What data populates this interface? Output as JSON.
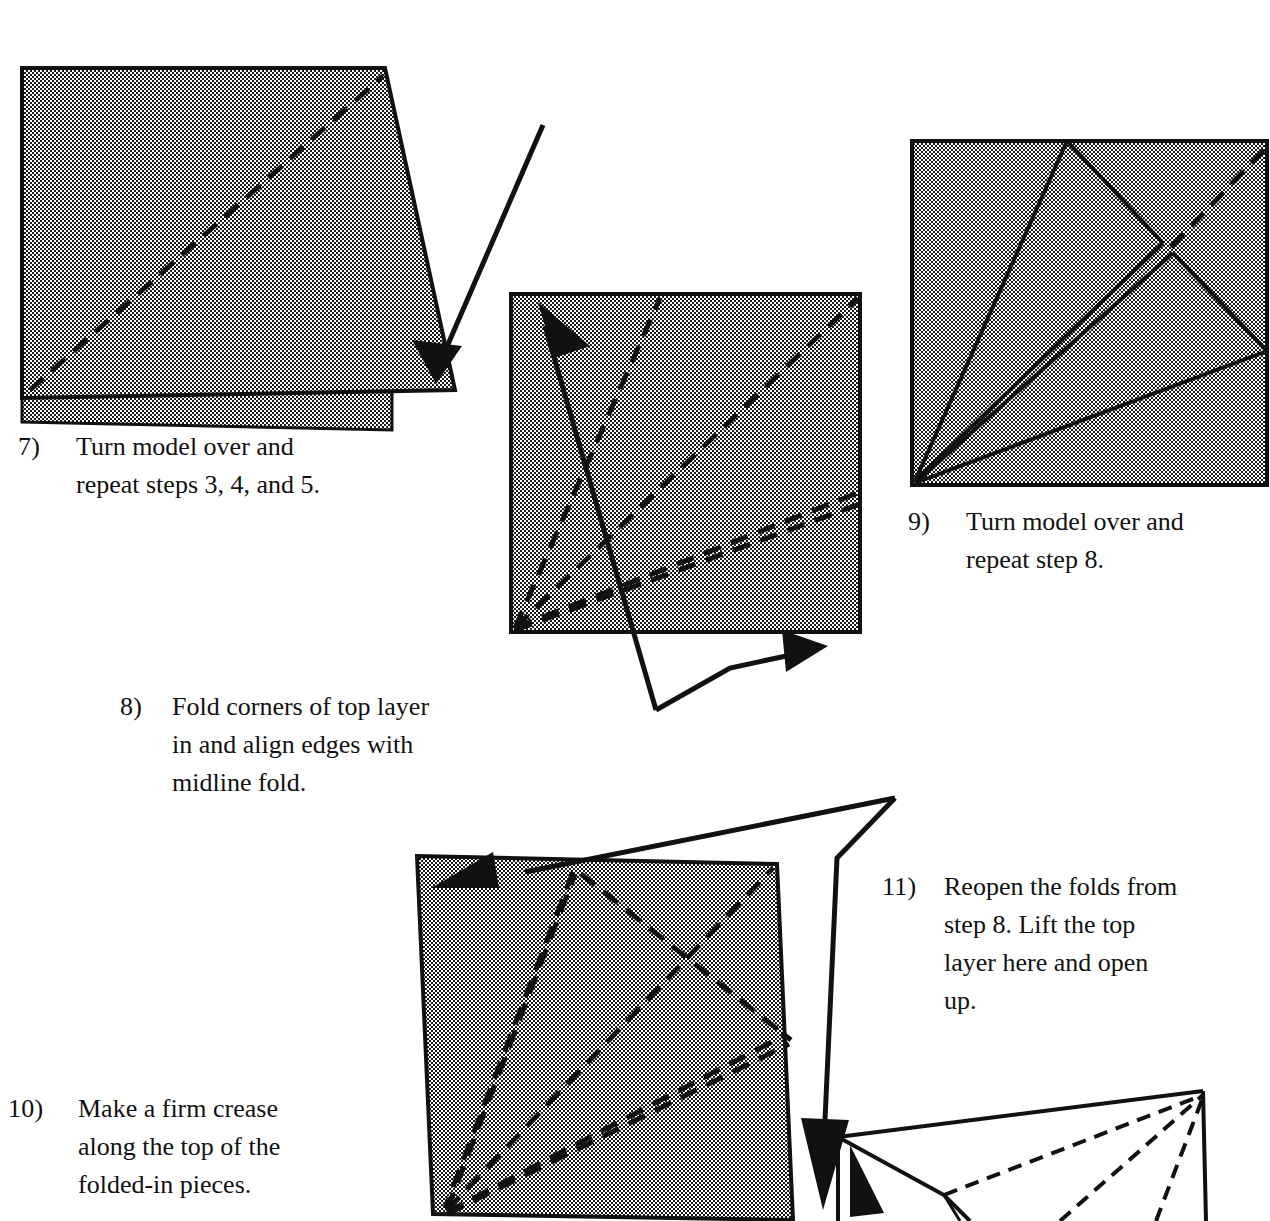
{
  "document": {
    "type": "origami-instruction-page",
    "background_color": "#ffffff",
    "ink_color": "#111111",
    "paper_fill": "halftone-gray-50"
  },
  "steps": [
    {
      "id": "step-7",
      "number": "7)",
      "lines": [
        "Turn model over and",
        "repeat steps 3, 4, and 5."
      ],
      "text": "Turn model over and repeat steps 3, 4, and 5."
    },
    {
      "id": "step-8",
      "number": "8)",
      "lines": [
        "Fold corners of top layer",
        "in and align edges with",
        "midline fold."
      ],
      "text": "Fold corners of top layer in and align edges with midline fold."
    },
    {
      "id": "step-9",
      "number": "9)",
      "lines": [
        "Turn model over and",
        "repeat step 8."
      ],
      "text": "Turn model over and repeat step 8."
    },
    {
      "id": "step-10",
      "number": "10)",
      "lines": [
        "Make a firm crease",
        "along the top of the",
        "folded-in pieces."
      ],
      "text": "Make a firm crease along the top of the folded-in pieces."
    },
    {
      "id": "step-11",
      "number": "11)",
      "lines": [
        "Reopen the folds from",
        "step 8. Lift the top",
        "layer here and open",
        "up."
      ],
      "text": "Reopen the folds from step 8. Lift the top layer here and open up."
    }
  ],
  "figures": [
    {
      "id": "figure-7",
      "caption_step": "7)",
      "description": "Shaded quadrilateral of folded paper with a dashed diagonal crease and a second layer showing beneath the lower edge; a turn-over arrow points into the right corner.",
      "shaded": true,
      "dashed_creases": 1,
      "arrows": [
        "turn-over-arrow"
      ]
    },
    {
      "id": "figure-8",
      "caption_step": "8)",
      "description": "Shaded square with four dashed creases radiating from the lower-left corner; a straight fold arrow crosses the square pointing up-left and a second arrow below points up-right.",
      "shaded": true,
      "dashed_creases": 4,
      "arrows": [
        "fold-arrow-up-left",
        "fold-arrow-up-right"
      ]
    },
    {
      "id": "figure-9",
      "caption_step": "9)",
      "description": "Shaded square with solid fold lines radiating from the lower-left corner forming folded-in flaps, and one dashed crease near the upper-right corner.",
      "shaded": true,
      "dashed_creases": 1,
      "solid_folds": 4,
      "arrows": []
    },
    {
      "id": "figure-10",
      "caption_step": "10)",
      "description": "Tilted shaded square covered with many dashed creases radiating from the lower-left corner and crossing diagonals; a long arrow sweeps from the upper-left corner around the right side pointing down.",
      "shaded": true,
      "dashed_creases": 6,
      "arrows": [
        "crease-arrow-left",
        "crease-arrow-down-right"
      ]
    },
    {
      "id": "figure-11",
      "caption_step": "11)",
      "description": "Unshaded three-dimensional view of the model with the top layer lifted, showing solid edges and dash-dot hidden fold lines converging at the right apex; an arrowhead marks where to lift.",
      "shaded": false,
      "dashed_creases": 3,
      "arrows": [
        "lift-arrowhead"
      ]
    }
  ]
}
